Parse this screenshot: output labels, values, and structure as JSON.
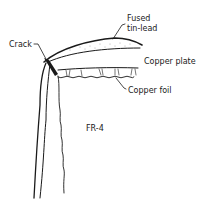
{
  "diagram": {
    "type": "cross-section",
    "labels": {
      "fused_line1": "Fused",
      "fused_line2": "tin-lead",
      "copper_plate": "Copper plate",
      "crack": "Crack",
      "copper_foil": "Copper foil",
      "substrate": "FR-4"
    },
    "colors": {
      "ink": "#1a1a1a",
      "background": "#ffffff"
    }
  }
}
